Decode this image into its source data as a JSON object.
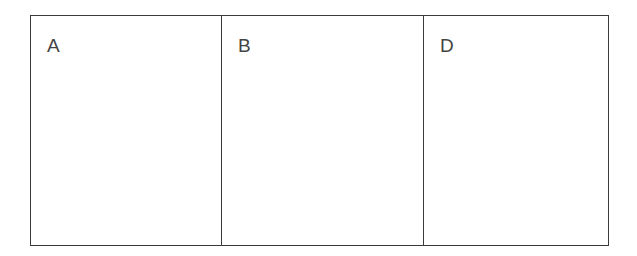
{
  "panels": [
    {
      "label": "A"
    },
    {
      "label": "B"
    },
    {
      "label": "D"
    }
  ]
}
